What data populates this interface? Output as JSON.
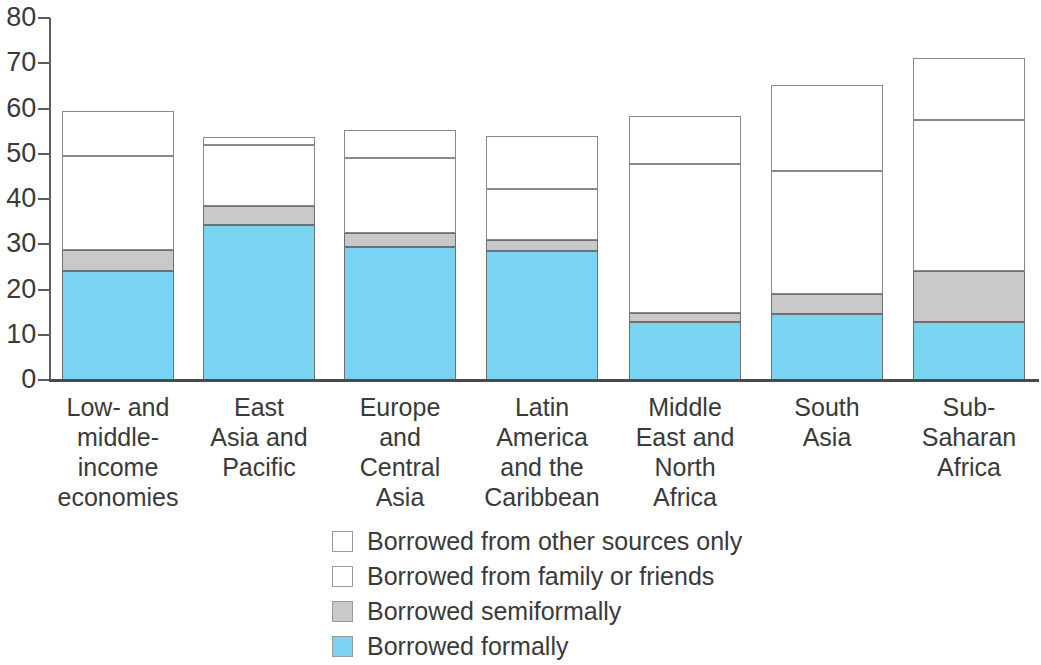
{
  "chart_data": {
    "type": "bar",
    "subtype": "stacked-bar",
    "title": "",
    "xlabel": "",
    "ylabel": "",
    "ylim": [
      0,
      80
    ],
    "ytick_step": 10,
    "yticks": [
      0,
      10,
      20,
      30,
      40,
      50,
      60,
      70,
      80
    ],
    "grid": false,
    "legend_position": "bottom-center",
    "stacked": true,
    "categories": [
      "Low- and middle-income economies",
      "East Asia and Pacific",
      "Europe and Central Asia",
      "Latin America and the Caribbean",
      "Middle East and North Africa",
      "South Asia",
      "Sub-Saharan Africa"
    ],
    "category_lines": [
      [
        "Low- and",
        "middle-",
        "income",
        "economies"
      ],
      [
        "East",
        "Asia and",
        "Pacific"
      ],
      [
        "Europe",
        "and",
        "Central",
        "Asia"
      ],
      [
        "Latin",
        "America",
        "and the",
        "Caribbean"
      ],
      [
        "Middle",
        "East and",
        "North",
        "Africa"
      ],
      [
        "South",
        "Asia"
      ],
      [
        "Sub-",
        "Saharan",
        "Africa"
      ]
    ],
    "series": [
      {
        "name": "Borrowed formally",
        "color": "#79d3f2",
        "values": [
          24.0,
          34.3,
          29.3,
          28.6,
          12.8,
          14.6,
          12.9
        ]
      },
      {
        "name": "Borrowed semiformally",
        "color": "#c9c9c9",
        "values": [
          4.8,
          4.1,
          3.2,
          2.3,
          2.0,
          4.4,
          11.1
        ]
      },
      {
        "name": "Borrowed from family or friends",
        "color": "#ffffff",
        "values": [
          20.7,
          13.5,
          16.5,
          11.4,
          33.0,
          27.1,
          33.5
        ]
      },
      {
        "name": "Borrowed from other sources only",
        "color": "#ffffff",
        "values": [
          9.9,
          1.7,
          6.3,
          11.6,
          10.6,
          19.1,
          13.6
        ]
      }
    ],
    "stack_totals": [
      59.4,
      53.6,
      55.3,
      53.9,
      58.4,
      65.2,
      71.1
    ],
    "segment_tops": {
      "formal": [
        24.0,
        34.3,
        29.3,
        28.6,
        12.8,
        14.6,
        12.9
      ],
      "semiformal": [
        28.8,
        38.4,
        32.5,
        30.9,
        14.8,
        19.0,
        24.0
      ],
      "family": [
        49.5,
        51.9,
        49.0,
        42.3,
        47.8,
        46.1,
        57.5
      ],
      "other": [
        59.4,
        53.6,
        55.3,
        53.9,
        58.4,
        65.2,
        71.1
      ]
    }
  },
  "axis": {
    "y_tick_labels": [
      "80",
      "70",
      "60",
      "50",
      "40",
      "30",
      "20",
      "10",
      "0"
    ]
  },
  "legend": {
    "items": [
      {
        "label": "Borrowed from other sources only",
        "swatch": "#ffffff",
        "key": "other"
      },
      {
        "label": "Borrowed from family or friends",
        "swatch": "#ffffff",
        "key": "family"
      },
      {
        "label": "Borrowed semiformally",
        "swatch": "#c9c9c9",
        "key": "semiformal"
      },
      {
        "label": "Borrowed formally",
        "swatch": "#79d3f2",
        "key": "formal"
      }
    ]
  },
  "colors": {
    "formal": "#79d3f2",
    "semiformal": "#c9c9c9",
    "family": "#ffffff",
    "other": "#ffffff",
    "axis": "#4a4a4a",
    "text": "#3a3a3a",
    "outline": "#8a8a8a"
  }
}
